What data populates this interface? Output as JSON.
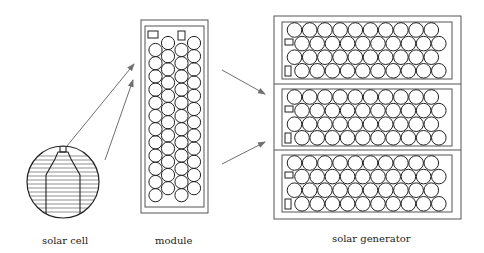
{
  "labels": {
    "cell": "solar cell",
    "module": "module",
    "generator": "solar generator"
  },
  "colors": {
    "line": "#222222",
    "frame": "#555555",
    "arrow": "#707070"
  },
  "module": {
    "columns": 4,
    "rows": 14
  },
  "generator": {
    "panels": 3,
    "rows_per_panel": 4,
    "cells_per_row": 10
  }
}
